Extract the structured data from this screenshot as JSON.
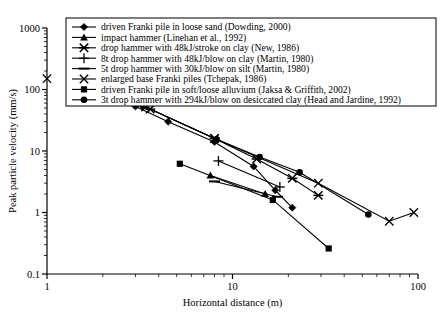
{
  "chart_data": {
    "type": "line",
    "title": "",
    "xlabel": "Horizontal distance (m)",
    "ylabel": "Peak particle velocity (mm/s)",
    "xscale": "log",
    "yscale": "log",
    "xlim": [
      1,
      100
    ],
    "ylim": [
      0.1,
      1000
    ],
    "xticks": [
      "1",
      "10",
      "100"
    ],
    "yticks": [
      "0.1",
      "1",
      "10",
      "100",
      "1000"
    ],
    "grid": false,
    "legend_position": "top-center",
    "series": [
      {
        "name": "driven Franki pile in loose sand (Dowding, 2000)",
        "marker": "diamond",
        "points": [
          [
            3.0,
            53
          ],
          [
            4.5,
            30
          ],
          [
            8.0,
            14
          ],
          [
            13.0,
            5.6
          ],
          [
            17.0,
            2.3
          ],
          [
            21.0,
            1.2
          ]
        ]
      },
      {
        "name": "impact hammer (Linehan et al., 1992)",
        "marker": "triangle",
        "points": [
          [
            7.6,
            4.0
          ],
          [
            15.0,
            2.0
          ]
        ]
      },
      {
        "name": "drop hammer with 48kJ/stroke on clay (New, 1986)",
        "marker": "asterisk",
        "points": [
          [
            3.6,
            48
          ],
          [
            8.0,
            16
          ],
          [
            13.5,
            7.4
          ],
          [
            21.0,
            3.6
          ],
          [
            29.0,
            1.9
          ]
        ]
      },
      {
        "name": "8t drop hammer with 48kJ/blow on clay (Martin, 1980)",
        "marker": "plus",
        "points": [
          [
            8.4,
            6.9
          ],
          [
            18.0,
            2.6
          ]
        ]
      },
      {
        "name": "5t drop hammer with 30kJ/blow on silt (Martin, 1980)",
        "marker": "dash",
        "points": [
          [
            8.0,
            3.2
          ],
          [
            17.5,
            1.8
          ]
        ]
      },
      {
        "name": "enlarged base Franki piles (Tchepak, 1986)",
        "marker": "cross",
        "points": [
          [
            3.4,
            52
          ],
          [
            8.0,
            16
          ],
          [
            29.0,
            3.0
          ],
          [
            70.0,
            0.72
          ],
          [
            95.0,
            1.0
          ]
        ]
      },
      {
        "name": "driven Franki pile in soft/loose alluvium (Jaksa & Griffith, 2002)",
        "marker": "square",
        "points": [
          [
            5.2,
            6.2
          ],
          [
            16.5,
            1.6
          ],
          [
            33.0,
            0.26
          ]
        ]
      },
      {
        "name": "3t drop hammer with 294kJ/blow on desiccated clay (Head and Jardine, 1992)",
        "marker": "circle",
        "points": [
          [
            3.3,
            54
          ],
          [
            8.2,
            15.5
          ],
          [
            14.0,
            8.0
          ],
          [
            23.0,
            4.5
          ],
          [
            54.0,
            0.93
          ]
        ]
      }
    ],
    "standalone_markers": [
      {
        "marker": "cross",
        "x": 1.0,
        "y": 150
      }
    ]
  },
  "legend": {
    "items": [
      {
        "marker": "diamond",
        "label": "driven Franki pile in loose sand (Dowding, 2000)"
      },
      {
        "marker": "triangle",
        "label": "impact hammer (Linehan et al., 1992)"
      },
      {
        "marker": "asterisk",
        "label": "drop hammer with 48kJ/stroke on clay (New, 1986)"
      },
      {
        "marker": "plus",
        "label": "8t drop hammer with 48kJ/blow on clay (Martin, 1980)"
      },
      {
        "marker": "dash",
        "label": "5t drop hammer with 30kJ/blow on silt (Martin, 1980)"
      },
      {
        "marker": "cross",
        "label": "enlarged base Franki piles (Tchepak, 1986)"
      },
      {
        "marker": "square",
        "label": "driven Franki pile in soft/loose alluvium (Jaksa & Griffith, 2002)"
      },
      {
        "marker": "circle",
        "label": "3t drop hammer with 294kJ/blow on desiccated clay (Head and Jardine, 1992)"
      }
    ]
  },
  "colors": {
    "line": "#000000",
    "axis": "#000000",
    "background": "#ffffff",
    "legend_border": "#000000"
  }
}
